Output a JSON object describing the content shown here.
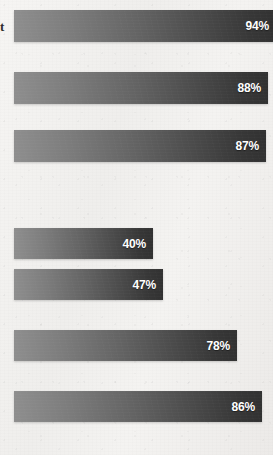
{
  "page": {
    "background_color": "#f3f2f0",
    "margin_artifact_text": "t"
  },
  "chart_data": {
    "type": "bar",
    "orientation": "horizontal",
    "title": "",
    "subtitle": "",
    "xlabel": "",
    "ylabel": "",
    "xlim": [
      0,
      100
    ],
    "grid": false,
    "legend": false,
    "legend_position": "none",
    "categories": [
      "",
      "",
      "",
      "",
      "",
      "",
      ""
    ],
    "values": [
      94,
      88,
      87,
      40,
      47,
      78,
      86
    ],
    "data_labels": [
      "94%",
      "88%",
      "87%",
      "40%",
      "47%",
      "78%",
      "86%"
    ],
    "bar_gradient_start_color": "#8e8e8e",
    "bar_gradient_end_color": "#313131",
    "data_label_color": "#ffffff"
  },
  "bars": [
    {
      "label": "94%",
      "value": 94,
      "top": 10,
      "height": 32,
      "left": 14,
      "width": 262
    },
    {
      "label": "88%",
      "value": 88,
      "top": 72,
      "height": 32,
      "left": 14,
      "width": 254
    },
    {
      "label": "87%",
      "value": 87,
      "top": 130,
      "height": 32,
      "left": 14,
      "width": 252
    },
    {
      "label": "40%",
      "value": 40,
      "top": 228,
      "height": 31,
      "left": 14,
      "width": 139
    },
    {
      "label": "47%",
      "value": 47,
      "top": 269,
      "height": 31,
      "left": 14,
      "width": 149
    },
    {
      "label": "78%",
      "value": 78,
      "top": 330,
      "height": 31,
      "left": 14,
      "width": 223
    },
    {
      "label": "86%",
      "value": 86,
      "top": 391,
      "height": 31,
      "left": 14,
      "width": 248
    }
  ]
}
